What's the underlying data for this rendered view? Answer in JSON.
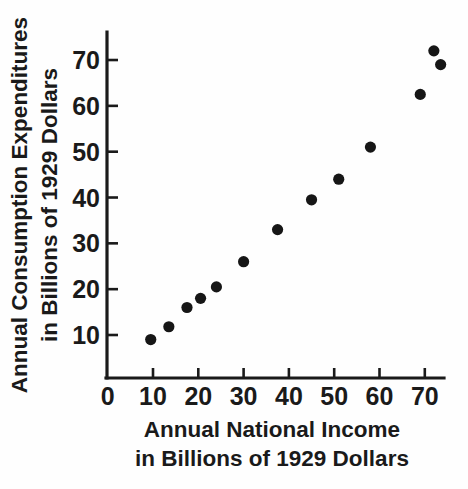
{
  "chart_data": {
    "type": "scatter",
    "title": "",
    "xlabel": "Annual National Income in Billions of 1929 Dollars",
    "ylabel": "Annual Consumption Expenditures in Billions of 1929 Dollars",
    "xlabel_lines": [
      "Annual National Income",
      "in Billions of 1929 Dollars"
    ],
    "ylabel_lines": [
      "Annual Consumption Expenditures",
      "in Billions of 1929 Dollars"
    ],
    "xlim": [
      0,
      76
    ],
    "ylim": [
      0,
      76
    ],
    "xticks": [
      0,
      10,
      20,
      30,
      40,
      50,
      60,
      70
    ],
    "yticks": [
      10,
      20,
      30,
      40,
      50,
      60,
      70
    ],
    "xtick_labels": [
      "0",
      "10",
      "20",
      "30",
      "40",
      "50",
      "60",
      "70"
    ],
    "ytick_labels": [
      "10",
      "20",
      "30",
      "40",
      "50",
      "60",
      "70"
    ],
    "grid": false,
    "legend": false,
    "marker": "filled-circle",
    "marker_color": "#161616",
    "axis_color": "#1a1a1a",
    "background_color": "#fefefe",
    "points": [
      {
        "x": 9.5,
        "y": 9.0
      },
      {
        "x": 13.5,
        "y": 11.8
      },
      {
        "x": 17.5,
        "y": 16.0
      },
      {
        "x": 20.5,
        "y": 18.0
      },
      {
        "x": 24.0,
        "y": 20.5
      },
      {
        "x": 30.0,
        "y": 26.0
      },
      {
        "x": 37.5,
        "y": 33.0
      },
      {
        "x": 45.0,
        "y": 39.5
      },
      {
        "x": 51.0,
        "y": 44.0
      },
      {
        "x": 58.0,
        "y": 51.0
      },
      {
        "x": 69.0,
        "y": 62.5
      },
      {
        "x": 72.0,
        "y": 72.0
      },
      {
        "x": 73.5,
        "y": 69.0
      }
    ]
  }
}
